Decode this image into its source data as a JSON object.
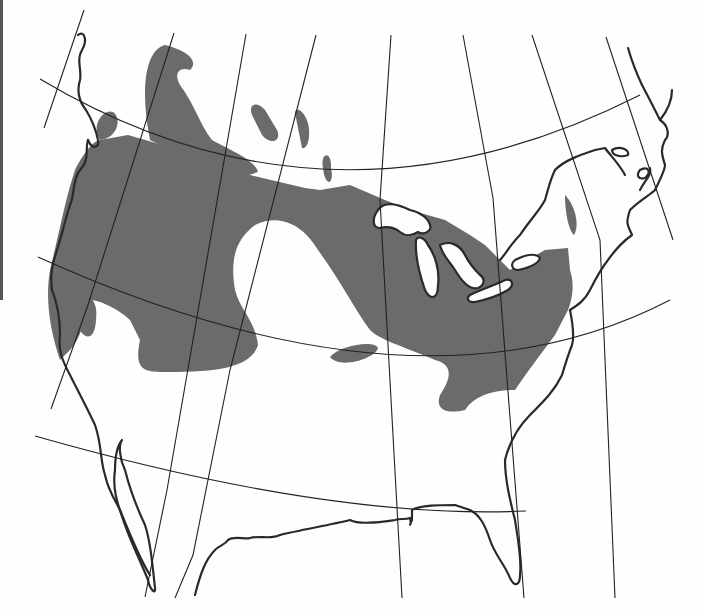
{
  "figure": {
    "type": "range map",
    "region": "North America (Canada, United States, northern Mexico)",
    "colors": {
      "background": "#fefefe",
      "range_fill": "#6b6b6b",
      "coastline": "#2a2a2a",
      "graticule": "#222222"
    }
  },
  "graticule": {
    "meridians": [
      "M84,10 L44,128",
      "M174,33 L88,305 L51,409",
      "M246,34 L167,490 L145,597",
      "M316,35 L230,370 L193,555 L175,598",
      "M391,35 L380,200 L402,598",
      "M463,35 L493,198 L524,598",
      "M532,35 L600,240 L615,598",
      "M606,37 L673,240"
    ],
    "parallels": [
      "M40,79 Q330,252 640,95",
      "M38,257 Q420,430 670,300",
      "M35,436 Q330,520 526,511"
    ]
  },
  "range_areas": [
    "M100,140 C90,125 104,108 113,112 C122,118 118,138 100,140 Z",
    "M104,150 C112,140 120,150 113,160 Z",
    "M150,140 C140,90 145,50 165,45 C185,50 200,60 190,70 C178,66 174,75 180,85 C195,105 200,125 212,140 C230,150 255,160 258,172 L249,175 L200,165 L170,150 Z",
    "M252,115 C248,105 256,100 265,110 L277,130 C282,142 270,145 262,135 Z",
    "M296,118 C292,108 300,106 306,118 C312,130 309,150 302,148 Z",
    "M323,168 C320,152 332,150 331,168 C335,185 325,188 323,168 Z",
    "M100,140 L128,135 L180,150 L250,175 L305,188 L320,190 L350,185 L385,200 L410,210 L445,220 L470,235 L485,245 L500,260 L510,270 L545,250 L568,248 L570,270 C575,285 572,300 568,310 L555,335 C540,355 525,375 515,390 C495,390 475,395 465,410 C445,415 435,408 440,395 C450,380 455,365 435,360 C400,345 380,340 370,330 C355,310 340,280 318,250 C300,220 275,215 255,225 C235,240 230,260 235,290 C240,310 255,320 258,345 C250,370 210,372 160,372 C140,372 135,365 140,340 L130,320 C120,310 100,300 90,300 C85,320 80,340 70,350 L60,360 C50,330 45,300 50,270 C60,230 65,200 75,170 C85,150 95,140 100,140 Z",
    "M60,300 C62,290 70,292 68,305 Z",
    "M65,300 C75,290 100,290 96,320 C95,340 85,340 80,330 C72,325 72,318 78,310 C75,305 68,305 65,300 Z",
    "M330,357 C340,345 375,340 378,348 C376,358 340,370 330,357 Z",
    "M565,195 C575,205 580,225 574,235 C568,230 565,210 565,195 Z"
  ],
  "coastline": [
    "M78,35 C84,30 88,40 82,50 C76,60 82,70 80,80 C77,90 78,100 86,110 C92,120 96,130 98,140 C100,148 92,150 88,140",
    "M88,140 C85,148 90,160 80,170 C72,180 75,195 70,205 C65,220 62,235 57,250 C52,265 50,275 52,290 C58,305 60,320 60,335 C58,350 62,360 70,375 C80,395 88,410 95,425 C102,445 100,460 105,475 C108,490 115,500 120,510 C128,530 140,560 150,575",
    "M122,440 C118,445 120,460 125,470 C130,490 138,510 145,525 C150,540 152,560 155,588 C156,595 150,590 148,580 C140,560 130,540 125,525 C118,505 112,490 115,470 C115,455 118,445 122,440 Z",
    "M195,595 C200,575 205,560 215,550 C220,545 225,545 228,540 C235,535 245,540 250,538 C260,535 270,540 280,535",
    "M280,535 C300,530 330,525 350,520 C360,525 380,522 395,520 C400,518 405,520 410,518 C412,525 408,528 412,520 L412,510 C420,505 440,505 455,505 L470,510 C480,515 485,525 490,540 C495,555 505,565 510,578 C515,588 520,585 520,575 C522,560 518,540 515,520 C510,500 505,480 505,460 C510,440 520,425 530,415 C545,400 555,390 562,375 C565,365 568,355 572,345 C575,335 572,320 570,310",
    "M570,310 C578,305 585,300 590,290 C595,280 600,270 608,260 C615,250 625,240 632,235 C628,225 625,225 630,210 C640,200 650,195 655,190 C660,180 665,170 665,165 C662,155 660,150 665,140 C670,135 668,125 660,120 C655,110 650,100 642,85 C635,70 630,55 628,48",
    "M660,120 C668,110 672,100 672,90",
    "M640,190 C645,180 652,175 650,168",
    "M612,150 C620,145 630,150 628,155 C620,158 612,155 612,150 Z",
    "M640,170 C648,165 652,172 645,178 C638,180 636,175 640,170 Z",
    "M555,170 C565,160 580,155 595,150 L605,148 C610,155 620,165 625,175",
    "M555,170 C550,180 548,190 545,200 C540,210 530,220 520,235 C510,245 505,255 500,260"
  ],
  "lakes": [
    "M378,210 C385,200 400,205 410,210 C420,212 428,218 430,225 C432,230 425,236 418,232 C412,236 405,236 400,232 C395,228 388,226 380,228 C372,228 372,218 378,210 Z",
    "M416,240 C415,255 418,270 425,290 C430,300 438,300 438,285 C440,270 435,255 428,245 C425,238 418,235 416,240 Z",
    "M440,245 C450,240 460,245 465,255 C470,265 475,270 480,275 C485,278 485,285 478,288 C470,290 462,282 455,270 C450,262 442,255 440,245 Z",
    "M470,295 C480,290 495,285 505,280 C512,278 515,285 508,290 C498,296 485,300 475,302 C468,303 466,298 470,295 Z",
    "M515,260 C525,255 535,252 540,258 C538,265 528,268 518,270 C512,270 510,264 515,260 Z"
  ]
}
